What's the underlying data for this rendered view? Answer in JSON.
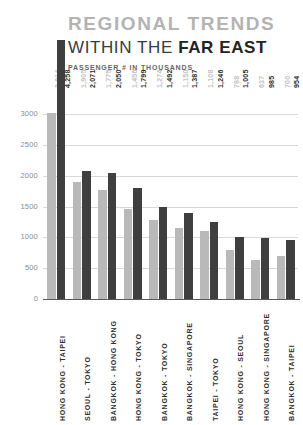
{
  "header": {
    "title_main": "REGIONAL TRENDS",
    "title_sub_prefix": "WITHIN THE ",
    "title_sub_strong": "FAR EAST",
    "subtitle": "PASSENGER # IN THOUSANDS"
  },
  "colors": {
    "series1": "#b9b9b9",
    "series2": "#3f3f3f",
    "title_main": "#b3b3b3",
    "title_sub": "#232323",
    "grid": "#d8d8d8",
    "axis": "#5a5a5a",
    "background": "#ffffff"
  },
  "chart_data": {
    "type": "bar",
    "title": "REGIONAL TRENDS WITHIN THE FAR EAST",
    "subtitle": "PASSENGER # IN THOUSANDS",
    "xlabel": "",
    "ylabel": "",
    "ylim": [
      0,
      3000
    ],
    "yticks": [
      0,
      500,
      1000,
      1500,
      2000,
      2500,
      3000
    ],
    "ytick_labels": [
      "0",
      "500",
      "1000",
      "1500",
      "2000",
      "2500",
      "3000"
    ],
    "grid": true,
    "legend": false,
    "grouped": true,
    "categories": [
      "HONG KONG - TAIPEI",
      "SEOUL - TOKYO",
      "BANGKOK - HONG KONG",
      "HONG KONG - TOKYO",
      "BANGKOK - TOKYO",
      "BANGKOK - SINGAPORE",
      "TAIPEI - TOKYO",
      "HONG KONG - SEOUL",
      "HONG KONG - SINGAPORE",
      "BANGKOK - TAIPEI"
    ],
    "series": [
      {
        "name": "series-1",
        "color": "#b9b9b9",
        "values": [
          3014,
          1905,
          1775,
          1456,
          1274,
          1150,
          1108,
          788,
          637,
          700
        ],
        "labels": [
          "3,014",
          "1,905",
          "1,775",
          "1,456",
          "1,274",
          "1,150",
          "1,108",
          "788",
          "637",
          "700"
        ]
      },
      {
        "name": "series-2",
        "color": "#3f3f3f",
        "values": [
          4258,
          2071,
          2050,
          1799,
          1492,
          1387,
          1246,
          1005,
          985,
          954
        ],
        "labels": [
          "4,258",
          "2,071",
          "2,050",
          "1,799",
          "1,492",
          "1,387",
          "1,246",
          "1,005",
          "985",
          "954"
        ]
      }
    ]
  }
}
